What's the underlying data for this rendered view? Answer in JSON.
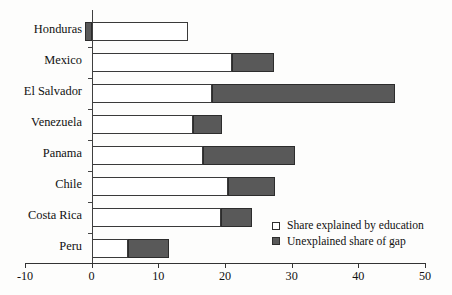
{
  "chart_data": {
    "type": "bar",
    "orientation": "horizontal",
    "stacked": true,
    "title": "",
    "subtitle": "",
    "xlabel": "",
    "ylabel": "",
    "xlim": [
      -10,
      50
    ],
    "xticks": [
      -10,
      0,
      10,
      20,
      30,
      40,
      50
    ],
    "xtick_labels": [
      "-10",
      "0",
      "10",
      "20",
      "30",
      "40",
      "50"
    ],
    "grid": false,
    "legend_position": "lower-right",
    "categories": [
      "Honduras",
      "Mexico",
      "El Salvador",
      "Venezuela",
      "Panama",
      "Chile",
      "Costa Rica",
      "Peru"
    ],
    "series": [
      {
        "name": "Share explained by education",
        "color": "#ffffff",
        "values": [
          14.4,
          21.0,
          18.0,
          15.2,
          16.7,
          20.4,
          19.4,
          5.4
        ]
      },
      {
        "name": "Unexplained share of gap",
        "color": "#595959",
        "values": [
          -1.0,
          6.3,
          27.5,
          4.3,
          13.8,
          7.1,
          4.6,
          6.2
        ]
      }
    ],
    "totals": [
      14.4,
      27.3,
      45.5,
      19.5,
      30.5,
      27.5,
      24.0,
      11.6
    ]
  },
  "legend": {
    "items": [
      {
        "swatch": "open",
        "label": "Share explained by education"
      },
      {
        "swatch": "filled",
        "label": "Unexplained share of gap"
      }
    ]
  },
  "colors": {
    "unexplained": "#595959",
    "explained": "#ffffff",
    "axis": "#333333",
    "text": "#111111"
  }
}
